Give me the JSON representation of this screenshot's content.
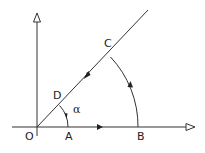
{
  "diagram": {
    "title": "",
    "labels": {
      "O": "O",
      "A": "A",
      "B": "B",
      "C": "C",
      "D": "D",
      "alpha": "α"
    },
    "colors": {
      "line": "#333333",
      "background": "#ffffff"
    }
  }
}
